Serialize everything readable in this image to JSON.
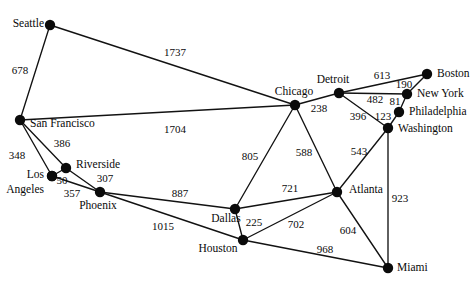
{
  "figure": {
    "kind": "weighted-undirected-graph",
    "width": 475,
    "height": 286,
    "background_color": "#ffffff",
    "node_color": "#0b0b0b",
    "edge_color": "#121212",
    "text_color": "#0a0a0a"
  },
  "nodes": [
    {
      "id": "seattle",
      "label": "Seattle",
      "x": 50,
      "y": 25,
      "label_x": 44,
      "label_y": 24,
      "anchor": "end"
    },
    {
      "id": "san_francisco",
      "label": "San Francisco",
      "x": 20,
      "y": 120,
      "label_x": 30,
      "label_y": 124,
      "anchor": "start"
    },
    {
      "id": "los_angeles",
      "label": "Los",
      "x": 52,
      "y": 176,
      "label_x": 44,
      "label_y": 175,
      "anchor": "end"
    },
    {
      "id": "los_angeles2",
      "label": "Angeles",
      "x": 52,
      "y": 176,
      "label_x": 44,
      "label_y": 190,
      "anchor": "end"
    },
    {
      "id": "riverside",
      "label": "Riverside",
      "x": 66,
      "y": 168,
      "label_x": 76,
      "label_y": 165,
      "anchor": "start"
    },
    {
      "id": "phoenix",
      "label": "Phoenix",
      "x": 100,
      "y": 192,
      "label_x": 98,
      "label_y": 206,
      "anchor": "mid"
    },
    {
      "id": "chicago",
      "label": "Chicago",
      "x": 295,
      "y": 105,
      "label_x": 294,
      "label_y": 92,
      "anchor": "mid"
    },
    {
      "id": "detroit",
      "label": "Detroit",
      "x": 339,
      "y": 93,
      "label_x": 333,
      "label_y": 80,
      "anchor": "mid"
    },
    {
      "id": "boston",
      "label": "Boston",
      "x": 427,
      "y": 74,
      "label_x": 437,
      "label_y": 74,
      "anchor": "start"
    },
    {
      "id": "new_york",
      "label": "New York",
      "x": 407,
      "y": 94,
      "label_x": 417,
      "label_y": 94,
      "anchor": "start"
    },
    {
      "id": "philadelphia",
      "label": "Philadelphia",
      "x": 399,
      "y": 112,
      "label_x": 409,
      "label_y": 112,
      "anchor": "start"
    },
    {
      "id": "washington",
      "label": "Washington",
      "x": 388,
      "y": 128,
      "label_x": 398,
      "label_y": 129,
      "anchor": "start"
    },
    {
      "id": "dallas",
      "label": "Dallas",
      "x": 235,
      "y": 209,
      "label_x": 226,
      "label_y": 219,
      "anchor": "mid"
    },
    {
      "id": "houston",
      "label": "Houston",
      "x": 243,
      "y": 240,
      "label_x": 218,
      "label_y": 249,
      "anchor": "mid"
    },
    {
      "id": "atlanta",
      "label": "Atlanta",
      "x": 337,
      "y": 192,
      "label_x": 349,
      "label_y": 190,
      "anchor": "start"
    },
    {
      "id": "miami",
      "label": "Miami",
      "x": 388,
      "y": 268,
      "label_x": 397,
      "label_y": 268,
      "anchor": "start"
    }
  ],
  "edges": [
    {
      "from": "seattle",
      "to": "chicago",
      "weight": "1737",
      "label_x": 175,
      "label_y": 52
    },
    {
      "from": "seattle",
      "to": "san_francisco",
      "weight": "678",
      "label_x": 20,
      "label_y": 70
    },
    {
      "from": "san_francisco",
      "to": "los_angeles",
      "weight": "348",
      "label_x": 17,
      "label_y": 155
    },
    {
      "from": "san_francisco",
      "to": "riverside",
      "weight": "386",
      "label_x": 62,
      "label_y": 143
    },
    {
      "from": "san_francisco",
      "to": "chicago",
      "weight": "1704",
      "label_x": 175,
      "label_y": 129
    },
    {
      "from": "los_angeles",
      "to": "riverside",
      "weight": "50",
      "label_x": 62,
      "label_y": 180
    },
    {
      "from": "los_angeles",
      "to": "phoenix",
      "weight": "357",
      "label_x": 72,
      "label_y": 193
    },
    {
      "from": "riverside",
      "to": "phoenix",
      "weight": "307",
      "label_x": 105,
      "label_y": 178
    },
    {
      "from": "phoenix",
      "to": "dallas",
      "weight": "887",
      "label_x": 180,
      "label_y": 193
    },
    {
      "from": "phoenix",
      "to": "houston",
      "weight": "1015",
      "label_x": 163,
      "label_y": 226
    },
    {
      "from": "chicago",
      "to": "detroit",
      "weight": "238",
      "label_x": 319,
      "label_y": 108
    },
    {
      "from": "chicago",
      "to": "dallas",
      "weight": "805",
      "label_x": 250,
      "label_y": 156
    },
    {
      "from": "chicago",
      "to": "atlanta",
      "weight": "588",
      "label_x": 304,
      "label_y": 152
    },
    {
      "from": "detroit",
      "to": "boston",
      "weight": "613",
      "label_x": 382,
      "label_y": 75
    },
    {
      "from": "detroit",
      "to": "new_york",
      "weight": "482",
      "label_x": 375,
      "label_y": 99
    },
    {
      "from": "detroit",
      "to": "washington",
      "weight": "396",
      "label_x": 358,
      "label_y": 116
    },
    {
      "from": "boston",
      "to": "new_york",
      "weight": "190",
      "label_x": 404,
      "label_y": 84
    },
    {
      "from": "new_york",
      "to": "philadelphia",
      "weight": "81",
      "label_x": 395,
      "label_y": 101
    },
    {
      "from": "philadelphia",
      "to": "washington",
      "weight": "123",
      "label_x": 383,
      "label_y": 116
    },
    {
      "from": "washington",
      "to": "atlanta",
      "weight": "543",
      "label_x": 359,
      "label_y": 151
    },
    {
      "from": "washington",
      "to": "miami",
      "weight": "923",
      "label_x": 400,
      "label_y": 198
    },
    {
      "from": "dallas",
      "to": "atlanta",
      "weight": "721",
      "label_x": 290,
      "label_y": 188
    },
    {
      "from": "dallas",
      "to": "houston",
      "weight": "225",
      "label_x": 254,
      "label_y": 222
    },
    {
      "from": "houston",
      "to": "atlanta",
      "weight": "702",
      "label_x": 296,
      "label_y": 224
    },
    {
      "from": "houston",
      "to": "miami",
      "weight": "968",
      "label_x": 325,
      "label_y": 249
    },
    {
      "from": "atlanta",
      "to": "miami",
      "weight": "604",
      "label_x": 348,
      "label_y": 230
    }
  ]
}
